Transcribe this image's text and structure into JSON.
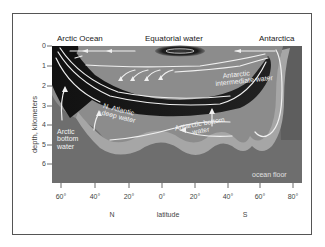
{
  "diagram": {
    "title_labels": {
      "left": "Arctic Ocean",
      "center": "Equatorial water",
      "right": "Antarctica"
    },
    "y_axis": {
      "label": "depth, kilometers",
      "ticks": [
        "0",
        "1",
        "2",
        "3",
        "4",
        "5",
        "6"
      ]
    },
    "x_axis": {
      "label": "latitude",
      "ticks": [
        "60°",
        "40°",
        "20°",
        "0°",
        "20°",
        "40°",
        "60°",
        "80°"
      ],
      "hemisphere_north": "N",
      "hemisphere_south": "S"
    },
    "water_masses": {
      "antarctic_intermediate": "Antarctic intermediate water",
      "antarctic_intermediate_line1": "Antarctic",
      "antarctic_intermediate_line2": "intermediate water",
      "n_atlantic_deep_line1": "N. Atlantic",
      "n_atlantic_deep_line2": "deep water",
      "arctic_bottom_line1": "Arctic",
      "arctic_bottom_line2": "bottom",
      "arctic_bottom_line3": "water",
      "antarctic_bottom_line1": "Antarctic bottom",
      "antarctic_bottom_line2": "water",
      "ocean_floor": "ocean floor"
    },
    "colors": {
      "ocean_floor": "#6e6e6e",
      "water": "#8c8c8c",
      "bottom_water": "#a3a3a3",
      "deep_water": "#1a1a1a",
      "arrows": "#f0f0f0"
    }
  }
}
